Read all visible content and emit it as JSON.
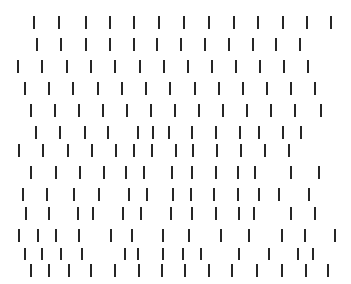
{
  "figure": {
    "type": "texture-pattern-stimulus",
    "background_color": "#ffffff",
    "mark_color": "#262626",
    "canvas": {
      "width": 351,
      "height": 284
    },
    "mark": {
      "width": 2,
      "height": 13
    },
    "row_count": 13,
    "total_marks": 166
  },
  "rows": [
    {
      "index": 1,
      "y": 16,
      "mark_height": 13,
      "count": 13,
      "x": [
        33,
        58,
        85,
        109,
        133,
        158,
        183,
        208,
        233,
        257,
        282,
        306,
        330
      ]
    },
    {
      "index": 2,
      "y": 38,
      "mark_height": 13,
      "count": 12,
      "x": [
        36,
        60,
        85,
        109,
        133,
        156,
        180,
        204,
        228,
        252,
        275,
        299
      ]
    },
    {
      "index": 3,
      "y": 60,
      "mark_height": 13,
      "count": 13,
      "x": [
        17,
        41,
        66,
        90,
        114,
        139,
        163,
        187,
        211,
        235,
        259,
        283,
        307
      ]
    },
    {
      "index": 4,
      "y": 82,
      "mark_height": 13,
      "count": 13,
      "x": [
        24,
        48,
        72,
        97,
        121,
        145,
        169,
        194,
        218,
        242,
        266,
        290,
        314
      ]
    },
    {
      "index": 5,
      "y": 104,
      "mark_height": 13,
      "count": 13,
      "x": [
        30,
        54,
        78,
        102,
        126,
        150,
        174,
        198,
        222,
        246,
        270,
        294,
        320
      ]
    },
    {
      "index": 6,
      "y": 126,
      "mark_height": 13,
      "count": 14,
      "x": [
        35,
        59,
        84,
        107,
        137,
        152,
        168,
        191,
        215,
        239,
        258,
        282,
        300
      ]
    },
    {
      "index": 7,
      "y": 144,
      "mark_height": 13,
      "count": 13,
      "x": [
        18,
        42,
        67,
        91,
        115,
        133,
        151,
        175,
        192,
        216,
        240,
        264,
        288
      ]
    },
    {
      "index": 8,
      "y": 166,
      "mark_height": 13,
      "count": 13,
      "x": [
        30,
        55,
        79,
        103,
        125,
        143,
        171,
        191,
        215,
        237,
        254,
        290,
        318
      ]
    },
    {
      "index": 9,
      "y": 188,
      "mark_height": 13,
      "count": 13,
      "x": [
        22,
        46,
        73,
        98,
        128,
        146,
        172,
        190,
        213,
        237,
        258,
        278,
        308
      ]
    },
    {
      "index": 10,
      "y": 207,
      "mark_height": 13,
      "count": 13,
      "x": [
        25,
        48,
        77,
        92,
        122,
        140,
        170,
        191,
        215,
        238,
        253,
        290,
        314
      ]
    },
    {
      "index": 11,
      "y": 229,
      "mark_height": 13,
      "count": 14,
      "x": [
        18,
        37,
        55,
        78,
        110,
        131,
        162,
        188,
        220,
        248,
        281,
        304,
        334
      ]
    },
    {
      "index": 12,
      "y": 248,
      "mark_height": 12,
      "count": 15,
      "x": [
        24,
        41,
        60,
        81,
        124,
        137,
        162,
        182,
        200,
        238,
        268,
        297,
        312
      ]
    },
    {
      "index": 13,
      "y": 264,
      "mark_height": 13,
      "count": 13,
      "x": [
        30,
        48,
        68,
        90,
        114,
        138,
        161,
        184,
        208,
        231,
        256,
        281,
        305,
        327
      ]
    }
  ]
}
